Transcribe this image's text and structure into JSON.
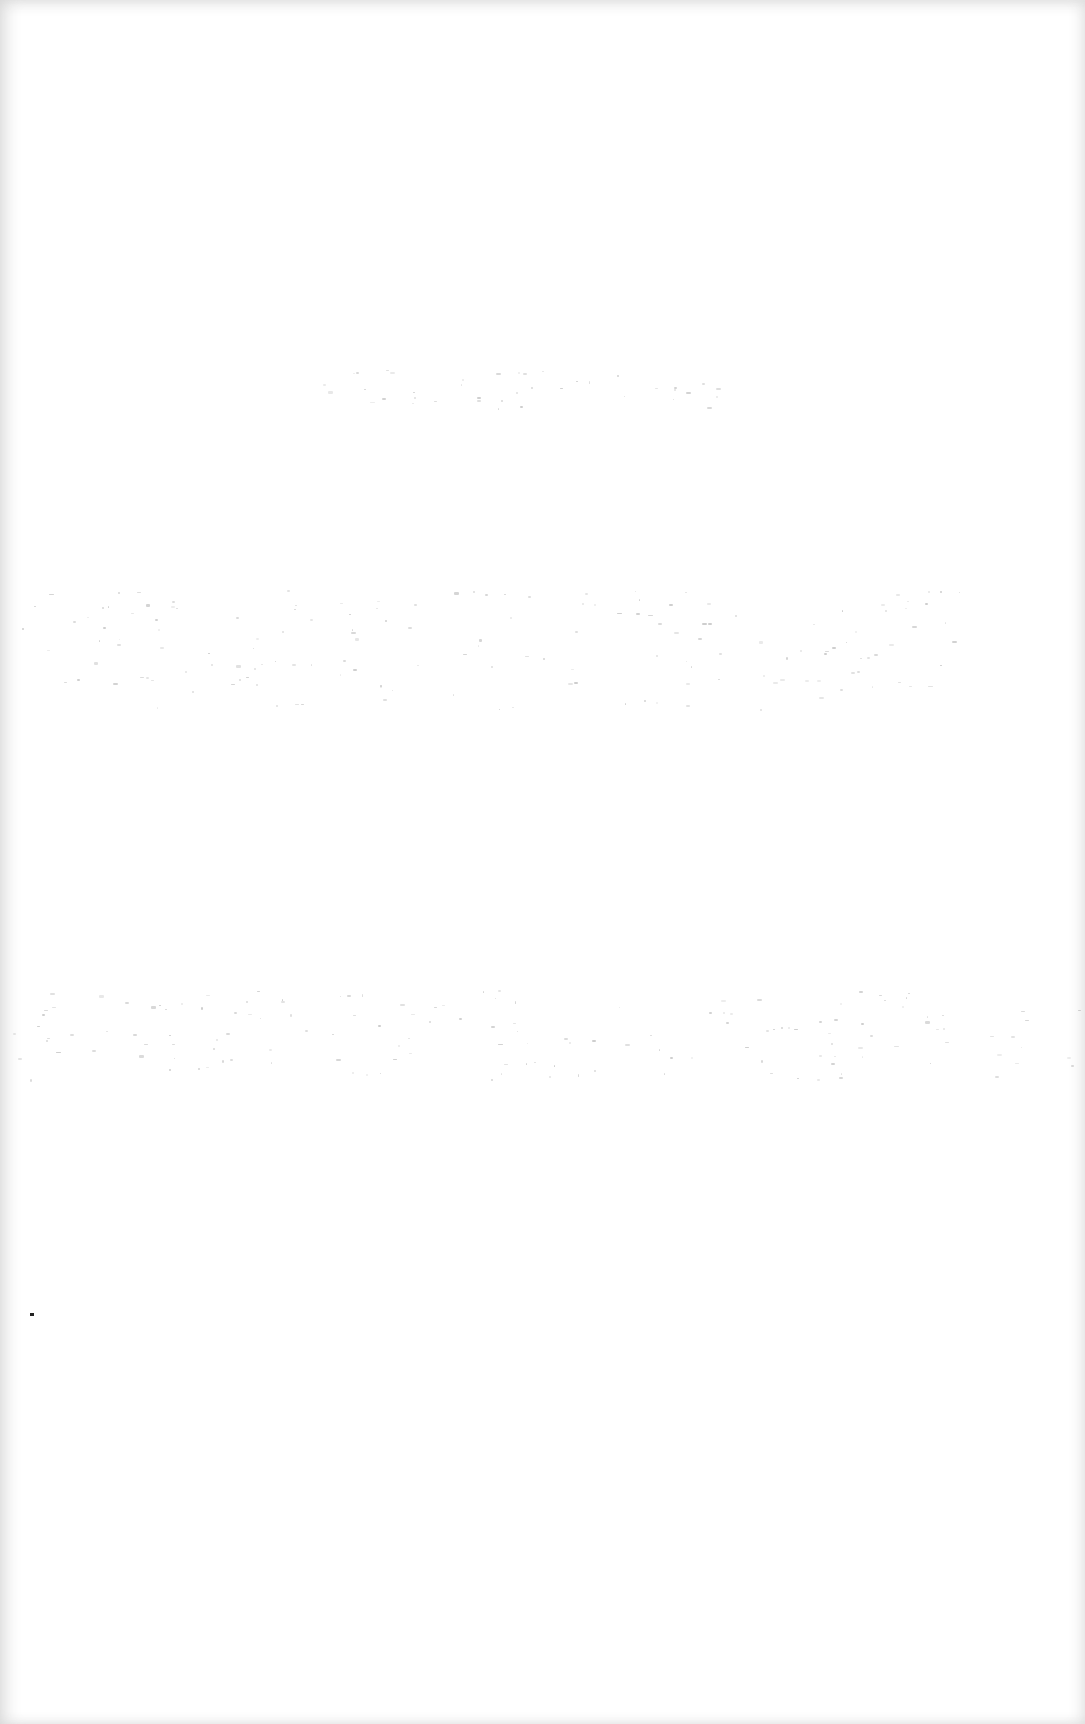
{
  "document": {
    "type": "blank scanned page",
    "background": "#ffffff",
    "edge_shade": "#d6d6d6",
    "bleed_through_color": "#b8b8b8",
    "visible_text": ""
  }
}
